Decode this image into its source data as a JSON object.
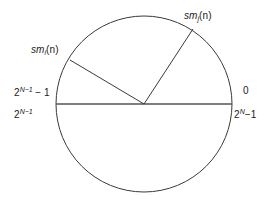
{
  "figure": {
    "type": "modular-number-circle",
    "background_color": "#ffffff",
    "stroke_color": "#3a3a3a",
    "geometry": {
      "center_x": 144,
      "center_y": 104,
      "radius": 88,
      "diameter_line": {
        "x1": 56,
        "y1": 104,
        "x2": 232,
        "y2": 104
      },
      "vector_i": {
        "x1": 144,
        "y1": 104,
        "x2": 70,
        "y2": 60
      },
      "vector_j": {
        "x1": 144,
        "y1": 104,
        "x2": 193,
        "y2": 29
      }
    }
  },
  "labels": {
    "vector_i": {
      "base": "sm",
      "subscript": "i",
      "arg": "(n)"
    },
    "vector_j": {
      "base": "sm",
      "subscript": "j",
      "arg": "(n)"
    },
    "left_upper": {
      "base": "2",
      "exponent": "N−1",
      "suffix": "− 1"
    },
    "left_lower": {
      "base": "2",
      "exponent": "N−1",
      "suffix": ""
    },
    "right_upper": {
      "text": "0"
    },
    "right_lower": {
      "base": "2",
      "exponent": "N",
      "suffix": "−1"
    }
  }
}
